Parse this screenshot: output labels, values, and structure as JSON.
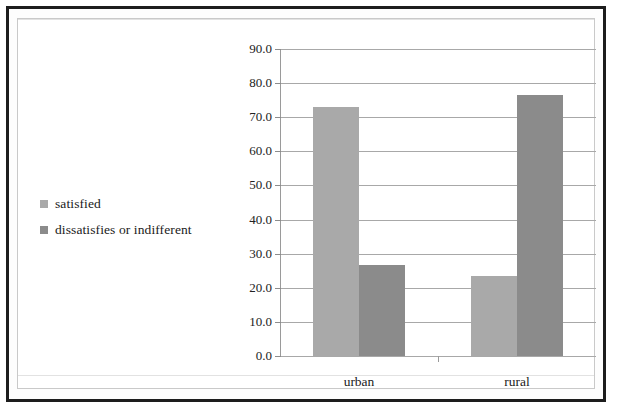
{
  "chart_data": {
    "type": "bar",
    "title": "",
    "xlabel": "",
    "ylabel": "",
    "categories": [
      "urban",
      "rural"
    ],
    "series": [
      {
        "name": "satisfied",
        "values": [
          73.0,
          23.5
        ],
        "color": "#a9a9a9"
      },
      {
        "name": "dissatisfies or indifferent",
        "values": [
          26.8,
          76.5
        ],
        "color": "#8b8b8b"
      }
    ],
    "ylim": [
      0.0,
      90.0
    ],
    "ytick_step": 10.0,
    "ytick_labels": [
      "90.0",
      "80.0",
      "70.0",
      "60.0",
      "50.0",
      "40.0",
      "30.0",
      "20.0",
      "10.0",
      "0.0"
    ],
    "ytick_values": [
      90.0,
      80.0,
      70.0,
      60.0,
      50.0,
      40.0,
      30.0,
      20.0,
      10.0,
      0.0
    ],
    "grid": true,
    "grid_axis": "y",
    "legend_position": "left",
    "legend": [
      {
        "label": "satisfied",
        "swatch_color": "#a9a9a9"
      },
      {
        "label": "dissatisfies or indifferent",
        "swatch_color": "#8b8b8b"
      }
    ]
  },
  "frame": {
    "outer_border_color": "#1d1d1d",
    "inner_border_color": "#c9c9c9",
    "background_color": "#ffffff"
  },
  "axis": {
    "line_color": "#9a9a9a",
    "gridline_color": "#a8a8a8",
    "tick_color": "#8c8c8c",
    "label_color": "#222222"
  }
}
